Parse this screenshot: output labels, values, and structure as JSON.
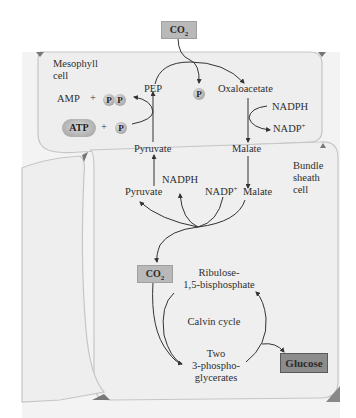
{
  "colors": {
    "cell_fill": "#efefef",
    "cell_border": "#c8c8c8",
    "box_fill": "#b9b9b9",
    "glucose_fill": "#8c8c8c",
    "arrow": "#333333",
    "corner_triangle": "#777777"
  },
  "cells": {
    "mesophyll": {
      "label_line1": "Mesophyll",
      "label_line2": "cell"
    },
    "bundle_sheath": {
      "label_line1": "Bundle",
      "label_line2": "sheath",
      "label_line3": "cell"
    }
  },
  "input": {
    "co2_label": "CO",
    "co2_sub": "2"
  },
  "mesophyll": {
    "pep": "PEP",
    "phosphate": "P",
    "oxaloacetate": "Oxaloacetate",
    "nadph": "NADPH",
    "nadp_plus": "NADP",
    "nadp_sup": "+",
    "malate": "Malate",
    "pyruvate": "Pyruvate",
    "amp": "AMP",
    "plus1": "+",
    "pp_1": "P",
    "pp_2": "P",
    "atp": "ATP",
    "plus2": "+",
    "pi": "P"
  },
  "bundle": {
    "pyruvate": "Pyruvate",
    "nadph": "NADPH",
    "nadp_plus": "NADP",
    "nadp_sup": "+",
    "malate": "Malate",
    "co2_label": "CO",
    "co2_sub": "2"
  },
  "calvin": {
    "rubp_line1": "Ribulose-",
    "rubp_line2": "1,5-bisphosphate",
    "cycle_label": "Calvin cycle",
    "pga_line1": "Two",
    "pga_line2": "3-phospho-",
    "pga_line3": "glycerates",
    "output": "Glucose"
  }
}
